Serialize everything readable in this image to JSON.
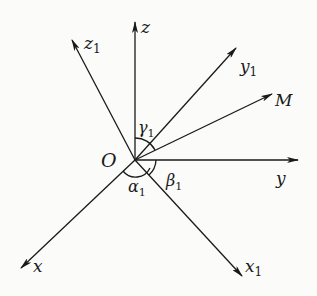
{
  "diagram": {
    "type": "coordinate-rotation",
    "origin": {
      "label": "O",
      "x": 135,
      "y": 160
    },
    "axes": [
      {
        "id": "z",
        "base": "z",
        "sub": "",
        "tip": [
          135,
          22
        ],
        "label_pos": [
          141,
          33
        ]
      },
      {
        "id": "z1",
        "base": "z",
        "sub": "1",
        "tip": [
          72,
          40
        ],
        "label_pos": [
          84,
          49
        ]
      },
      {
        "id": "y1",
        "base": "y",
        "sub": "1",
        "tip": [
          236,
          48
        ],
        "label_pos": [
          240,
          72
        ]
      },
      {
        "id": "M",
        "base": "M",
        "sub": "",
        "tip": [
          272,
          94
        ],
        "label_pos": [
          275,
          106
        ]
      },
      {
        "id": "y",
        "base": "y",
        "sub": "",
        "tip": [
          298,
          160
        ],
        "label_pos": [
          276,
          184
        ]
      },
      {
        "id": "x",
        "base": "x",
        "sub": "",
        "tip": [
          21,
          268
        ],
        "label_pos": [
          33,
          272
        ]
      },
      {
        "id": "x1",
        "base": "x",
        "sub": "1",
        "tip": [
          242,
          276
        ],
        "label_pos": [
          245,
          272
        ]
      }
    ],
    "angles": [
      {
        "id": "gamma1",
        "base": "γ",
        "sub": "1",
        "label_pos": [
          138,
          133
        ]
      },
      {
        "id": "alpha1",
        "base": "α",
        "sub": "1",
        "label_pos": [
          128,
          192
        ]
      },
      {
        "id": "beta1",
        "base": "β",
        "sub": "1",
        "label_pos": [
          166,
          186
        ]
      }
    ],
    "colors": {
      "stroke": "#1a1a1a",
      "background": "#fbfbfa"
    }
  }
}
